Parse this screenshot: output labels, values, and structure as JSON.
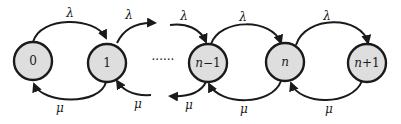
{
  "diagram": {
    "type": "birth-death-markov-chain",
    "states": [
      {
        "id": "s0",
        "label": "0",
        "cx": 33,
        "cy": 61
      },
      {
        "id": "s1",
        "label": "1",
        "cx": 107,
        "cy": 63
      },
      {
        "id": "sn_minus_1",
        "label": "n−1",
        "cx": 208,
        "cy": 63
      },
      {
        "id": "sn",
        "label": "n",
        "cx": 285,
        "cy": 62
      },
      {
        "id": "sn_plus_1",
        "label": "n+1",
        "cx": 367,
        "cy": 63
      }
    ],
    "ellipsis": "······",
    "arrival_rate": "λ",
    "service_rate": "μ",
    "edges": {
      "forward": [
        {
          "from": "0",
          "to": "1",
          "label": "λ"
        },
        {
          "from": "1",
          "to": "…",
          "label": "λ"
        },
        {
          "from": "…",
          "to": "n−1",
          "label": "λ"
        },
        {
          "from": "n−1",
          "to": "n",
          "label": "λ"
        },
        {
          "from": "n",
          "to": "n+1",
          "label": "λ"
        }
      ],
      "backward": [
        {
          "from": "1",
          "to": "0",
          "label": "μ"
        },
        {
          "from": "…",
          "to": "1",
          "label": "μ"
        },
        {
          "from": "n−1",
          "to": "…",
          "label": "μ"
        },
        {
          "from": "n",
          "to": "n−1",
          "label": "μ"
        },
        {
          "from": "n+1",
          "to": "n",
          "label": "μ"
        }
      ]
    }
  },
  "labels": {
    "lambda": "λ",
    "mu": "μ",
    "state_0": "0",
    "state_1": "1",
    "state_n_minus_1_n": "n",
    "state_n_minus_1_op": "−1",
    "state_n": "n",
    "state_n_plus_1_n": "n",
    "state_n_plus_1_op": "+1",
    "ellipsis": "······"
  }
}
